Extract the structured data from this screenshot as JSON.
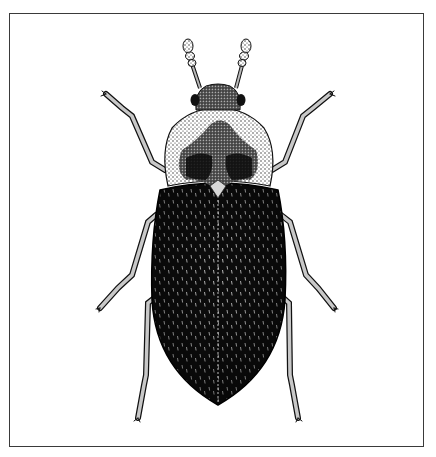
{
  "illustration": {
    "subject": "beetle",
    "view": "dorsal",
    "style": "black-and-white stipple ink drawing",
    "colors": {
      "background": "#ffffff",
      "frame": "#3a3a3a",
      "ink": "#111111",
      "stipple_light": "#9a9a9a"
    },
    "parts": [
      "antennae",
      "head",
      "eyes",
      "pronotum",
      "scutellum",
      "elytra",
      "front-legs",
      "middle-legs",
      "hind-legs"
    ]
  }
}
